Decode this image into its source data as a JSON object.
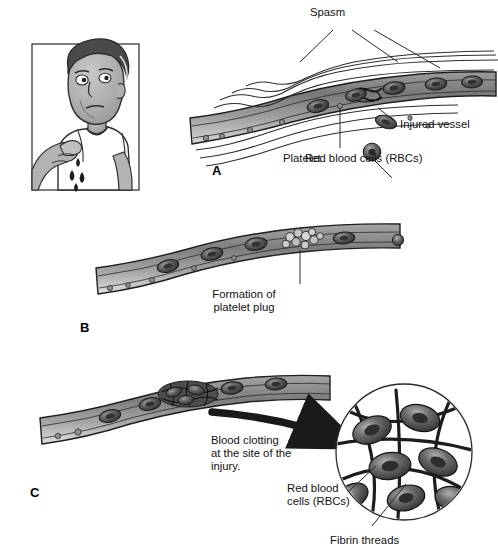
{
  "figure": {
    "panels": [
      {
        "id": "A",
        "letter": "A",
        "stage": "Vascular spasm and injured vessel"
      },
      {
        "id": "B",
        "letter": "B",
        "stage": "Formation of platelet plug"
      },
      {
        "id": "C",
        "letter": "C",
        "stage": "Coagulation / blood clotting"
      }
    ]
  },
  "labels": {
    "spasm": "Spasm",
    "injured_vessel": "Injured vessel",
    "platelet": "Platelet",
    "rbc_full": "Red blood cells (RBCs)",
    "platelet_plug_line1": "Formation of",
    "platelet_plug_line2": "platelet plug",
    "clotting_line1": "Blood clotting",
    "clotting_line2": "at the site of the",
    "clotting_line3": "injury.",
    "rbc_inset_line1": "Red blood",
    "rbc_inset_line2": "cells (RBCs)",
    "fibrin_threads": "Fibrin threads"
  },
  "panel_letters": {
    "a": "A",
    "b": "B",
    "c": "C"
  },
  "cartoon": {
    "name": "man-with-cut-finger",
    "description": "Grayscale cartoon of a man in a white t-shirt pointing at his cut finger with blood drops falling"
  },
  "colors": {
    "ink": "#111111",
    "vessel_dark": "#4a4a4a",
    "vessel_mid": "#8c8c8c",
    "vessel_light": "#c9c9c9",
    "rbc_dark": "#3c3c3c",
    "rbc_mid": "#6e6e6e",
    "skin": "#b5b5b5",
    "hair": "#4a4a4a",
    "shirt": "#ffffff",
    "background": "#ffffff"
  }
}
